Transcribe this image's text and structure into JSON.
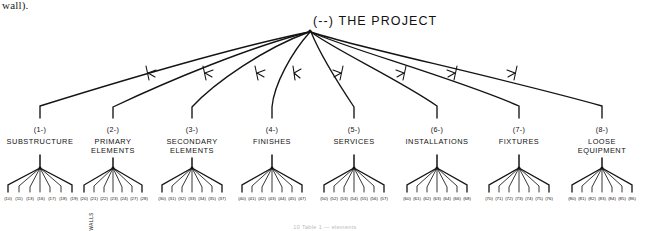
{
  "page": {
    "body_text_fragment": "wall).",
    "caption": "10 Table 1 — elements"
  },
  "diagram": {
    "title": "(--) THE PROJECT",
    "annotation_walls": "WALLS",
    "nodes": [
      {
        "code": "(1-)",
        "name_line1": "SUBSTRUCTURE",
        "name_line2": "",
        "leaves": [
          "(10)",
          "(11)",
          "(13)",
          "(16)",
          "(17)",
          "(18)",
          "(19)"
        ]
      },
      {
        "code": "(2-)",
        "name_line1": "PRIMARY",
        "name_line2": "ELEMENTS",
        "leaves": [
          "(20)",
          "(21)",
          "(22)",
          "(23)",
          "(24)",
          "(27)",
          "(28)"
        ]
      },
      {
        "code": "(3-)",
        "name_line1": "SECONDARY",
        "name_line2": "ELEMENTS",
        "leaves": [
          "(30)",
          "(31)",
          "(32)",
          "(33)",
          "(34)",
          "(35)",
          "(37)"
        ]
      },
      {
        "code": "(4-)",
        "name_line1": "FINISHES",
        "name_line2": "",
        "leaves": [
          "(40)",
          "(41)",
          "(42)",
          "(43)",
          "(44)",
          "(45)",
          "(47)"
        ]
      },
      {
        "code": "(5-)",
        "name_line1": "SERVICES",
        "name_line2": "",
        "leaves": [
          "(50)",
          "(52)",
          "(53)",
          "(54)",
          "(55)",
          "(56)",
          "(57)"
        ]
      },
      {
        "code": "(6-)",
        "name_line1": "INSTALLATIONS",
        "name_line2": "",
        "leaves": [
          "(60)",
          "(61)",
          "(62)",
          "(63)",
          "(64)",
          "(66)",
          "(68)"
        ]
      },
      {
        "code": "(7-)",
        "name_line1": "FIXTURES",
        "name_line2": "",
        "leaves": [
          "(70)",
          "(71)",
          "(72)",
          "(73)",
          "(74)",
          "(75)",
          "(76)"
        ]
      },
      {
        "code": "(8-)",
        "name_line1": "LOOSE",
        "name_line2": "EQUIPMENT",
        "leaves": [
          "(80)",
          "(81)",
          "(82)",
          "(83)",
          "(84)",
          "(85)",
          "(86)"
        ]
      }
    ],
    "colors": {
      "ink": "#141414",
      "paper": "#ffffff",
      "caption": "#b9b9b9"
    }
  }
}
